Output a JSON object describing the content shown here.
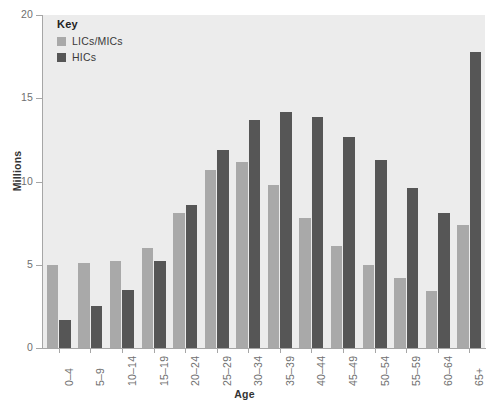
{
  "chart_data": {
    "type": "bar",
    "title": "",
    "xlabel": "Age",
    "ylabel": "Millions",
    "ylim": [
      0,
      20
    ],
    "yticks": [
      0,
      5,
      10,
      15,
      20
    ],
    "grid": false,
    "legend_position": "top-left",
    "legend_title": "Key",
    "categories": [
      "0–4",
      "5–9",
      "10–14",
      "15–19",
      "20–24",
      "25–29",
      "30–34",
      "35–39",
      "40–44",
      "45–49",
      "50–54",
      "55–59",
      "60–64",
      "65+"
    ],
    "series": [
      {
        "name": "LICs/MICs",
        "color": "#a9a9a9",
        "values": [
          5.0,
          5.1,
          5.2,
          6.0,
          8.1,
          10.7,
          11.2,
          9.8,
          7.8,
          6.1,
          5.0,
          4.2,
          3.4,
          7.4
        ]
      },
      {
        "name": "HICs",
        "color": "#565656",
        "values": [
          1.7,
          2.5,
          3.5,
          5.2,
          8.6,
          11.9,
          13.7,
          14.2,
          13.9,
          12.7,
          11.3,
          9.6,
          8.1,
          17.8
        ]
      }
    ]
  },
  "axes": {
    "y_title": "Millions",
    "x_title": "Age",
    "y_tick_labels": [
      "0",
      "5",
      "10",
      "15",
      "20"
    ]
  },
  "legend": {
    "title": "Key",
    "entries": [
      {
        "label": "LICs/MICs",
        "color": "#a9a9a9"
      },
      {
        "label": "HICs",
        "color": "#565656"
      }
    ]
  },
  "colors": {
    "plot_background": "#ececec",
    "page_background": "#ffffff",
    "axis": "#a6a6a6",
    "tick_text": "#6f6f6f",
    "axis_title": "#333333",
    "licmic": "#a9a9a9",
    "hic": "#565656"
  }
}
